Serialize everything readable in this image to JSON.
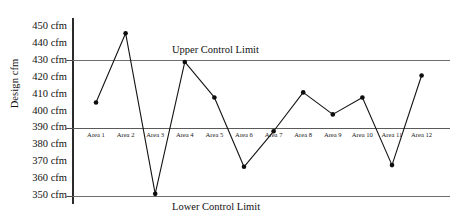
{
  "chart_data": {
    "type": "line",
    "title": "",
    "xlabel": "",
    "ylabel": "Design cfm",
    "categories": [
      "Area 1",
      "Area 2",
      "Area 3",
      "Area 4",
      "Area 5",
      "Area 6",
      "Area 7",
      "Area 8",
      "Area 9",
      "Area 10",
      "Area 11",
      "Area 12"
    ],
    "values": [
      405,
      446,
      351,
      429,
      408,
      367,
      388,
      411,
      398,
      408,
      368,
      421
    ],
    "series": [
      {
        "name": "Design cfm",
        "values": [
          405,
          446,
          351,
          429,
          408,
          367,
          388,
          411,
          398,
          408,
          368,
          421
        ]
      }
    ],
    "ylim": [
      345,
      455
    ],
    "yticks": [
      350,
      360,
      370,
      380,
      390,
      400,
      410,
      420,
      430,
      440,
      450
    ],
    "ytick_labels": [
      "350 cfm",
      "360 cfm",
      "370 cfm",
      "380 cfm",
      "390 cfm",
      "400 cfm",
      "410 cfm",
      "420 cfm",
      "430 cfm",
      "440 cfm",
      "450 cfm"
    ],
    "grid": false,
    "legend": "none",
    "reference_lines": [
      {
        "name": "upper-control-limit",
        "label": "Upper Control Limit",
        "value": 430
      },
      {
        "name": "design-line",
        "label": "",
        "value": 390
      },
      {
        "name": "lower-control-limit",
        "label": "Lower Control Limit",
        "value": 350
      }
    ],
    "marker": "filled-circle",
    "line_color": "#141414",
    "limit_line_color": "#6e6e6e"
  },
  "labels": {
    "upper_control_limit": "Upper Control Limit",
    "lower_control_limit": "Lower Control Limit",
    "y_axis_title": "Design cfm"
  }
}
